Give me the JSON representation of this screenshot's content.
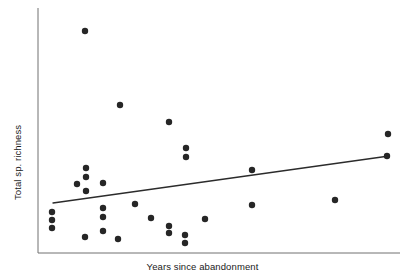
{
  "chart_data": {
    "type": "scatter",
    "title": "",
    "xlabel": "Years since abandonment",
    "ylabel": "Total sp. richness",
    "grid": false,
    "legend": null,
    "axis_ticks": {
      "x": [],
      "y": []
    },
    "axis_spines": [
      "left",
      "bottom"
    ],
    "xlim": [
      0,
      100
    ],
    "ylim": [
      0,
      100
    ],
    "point_color": "#262626",
    "point_radius_px": 3.2,
    "line_color": "#2b2b2b",
    "line_width_px": 1.3,
    "points_px": [
      [
        52,
        212
      ],
      [
        52,
        220
      ],
      [
        52,
        228
      ],
      [
        77,
        184
      ],
      [
        85,
        31
      ],
      [
        86,
        168
      ],
      [
        86,
        177
      ],
      [
        86,
        191
      ],
      [
        85,
        237
      ],
      [
        103,
        183
      ],
      [
        103,
        208
      ],
      [
        103,
        217
      ],
      [
        103,
        231
      ],
      [
        118,
        239
      ],
      [
        120,
        105
      ],
      [
        135,
        204
      ],
      [
        151,
        218
      ],
      [
        169,
        122
      ],
      [
        169,
        226
      ],
      [
        169,
        233
      ],
      [
        185,
        235
      ],
      [
        185,
        243
      ],
      [
        186,
        148
      ],
      [
        186,
        157
      ],
      [
        205,
        219
      ],
      [
        252,
        170
      ],
      [
        252,
        205
      ],
      [
        335,
        200
      ],
      [
        388,
        134
      ],
      [
        387,
        156
      ]
    ],
    "trendline_px": {
      "x1": 53,
      "y1": 203,
      "x2": 389,
      "y2": 156
    },
    "points_data": {
      "note": "Positive weak linear trend; one high outlier near left of range",
      "n": 30
    },
    "frame_px": {
      "left": 38,
      "right": 400,
      "top": 8,
      "bottom": 253
    }
  },
  "figure": {
    "background_color": "#ffffff"
  }
}
